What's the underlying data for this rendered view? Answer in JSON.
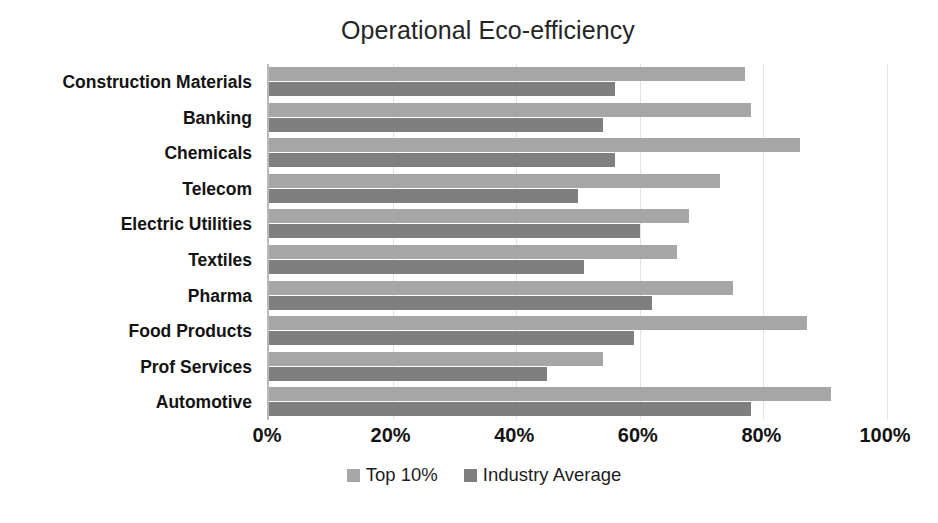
{
  "chart_data": {
    "type": "bar",
    "orientation": "horizontal",
    "title": "Operational Eco-efficiency",
    "xlabel": "",
    "ylabel": "",
    "xlim": [
      0,
      100
    ],
    "x_tick_labels": [
      "0%",
      "20%",
      "40%",
      "60%",
      "80%",
      "100%"
    ],
    "x_tick_values": [
      0,
      20,
      40,
      60,
      80,
      100
    ],
    "grid": "vertical",
    "legend_position": "bottom",
    "categories": [
      "Construction Materials",
      "Banking",
      "Chemicals",
      "Telecom",
      "Electric Utilities",
      "Textiles",
      "Pharma",
      "Food Products",
      "Prof Services",
      "Automotive"
    ],
    "series": [
      {
        "name": "Top 10%",
        "color": "#a6a6a6",
        "values": [
          77,
          78,
          86,
          73,
          68,
          66,
          75,
          87,
          54,
          91
        ]
      },
      {
        "name": "Industry Average",
        "color": "#7f7f7f",
        "values": [
          56,
          54,
          56,
          50,
          60,
          51,
          62,
          59,
          45,
          78
        ]
      }
    ]
  },
  "colors": {
    "top10": "#a6a6a6",
    "industry_average": "#7f7f7f",
    "gridline": "#e2e2e2",
    "axis": "#b9b9b9",
    "text": "#131313",
    "background": "#ffffff"
  }
}
